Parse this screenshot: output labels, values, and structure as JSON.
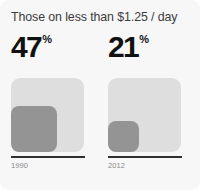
{
  "card": {
    "title": "Those on less than $1.25 / day",
    "background_color": "#f7f7f7"
  },
  "colors": {
    "square_outer": "#dedede",
    "square_inner": "#949494",
    "baseline": "#2f2f2f",
    "title_text": "#3b3b3b",
    "stat_text": "#111111",
    "year_text": "#8a8a8a"
  },
  "panels": [
    {
      "value": "47",
      "unit": "%",
      "year": "1990",
      "inner_size_px": 46
    },
    {
      "value": "21",
      "unit": "%",
      "year": "2012",
      "inner_size_px": 31
    }
  ],
  "chart_data": {
    "type": "bar",
    "title": "Those on less than $1.25 / day",
    "subtitle": "",
    "xlabel": "",
    "ylabel": "Share of population (%)",
    "categories": [
      "1990",
      "2012"
    ],
    "values": [
      47,
      21
    ],
    "value_labels": [
      "47%",
      "21%"
    ],
    "unit": "%",
    "ylim": [
      0,
      100
    ],
    "grid": false,
    "legend": false,
    "note": "Each value is drawn as a nested square: the light outer square represents 100% and the darker inner square is scaled so its side length is proportional to the value."
  }
}
